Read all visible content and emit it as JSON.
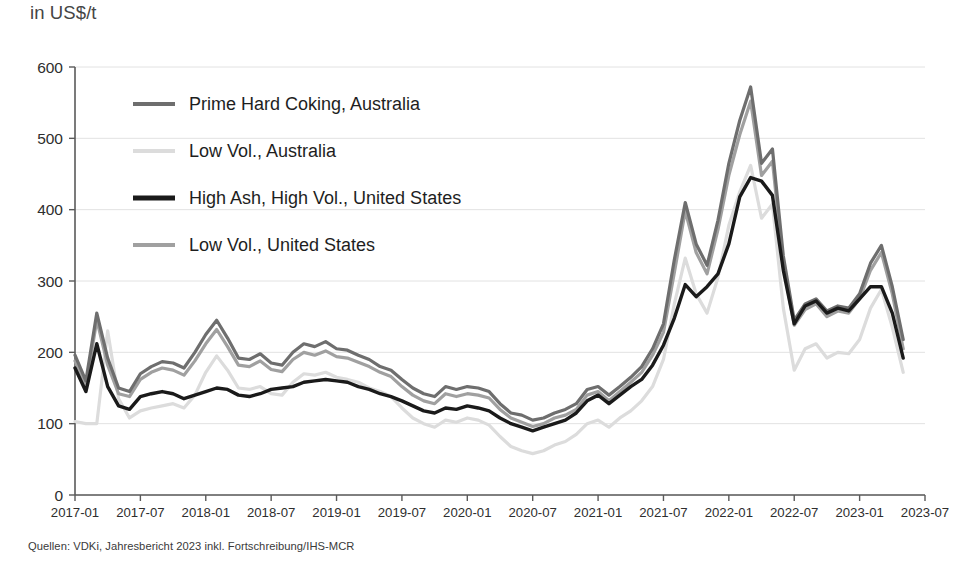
{
  "unit_label": "in US$/t",
  "source_note": "Quellen: VDKi, Jahresbericht 2023 inkl. Fortschreibung/IHS-MCR",
  "chart_data": {
    "type": "line",
    "title": "",
    "subtitle": "",
    "xlabel": "",
    "ylabel": "in US$/t",
    "ylim": [
      0,
      600
    ],
    "yticks": [
      0,
      100,
      200,
      300,
      400,
      500,
      600
    ],
    "xticks": [
      "2017-01",
      "2017-07",
      "2018-01",
      "2018-07",
      "2019-01",
      "2019-07",
      "2020-01",
      "2020-07",
      "2021-01",
      "2021-07",
      "2022-01",
      "2022-07",
      "2023-01",
      "2023-07"
    ],
    "grid": true,
    "legend_position": "upper-left",
    "x_start": "2017-01",
    "x_step_months": 1,
    "x": [
      "2017-01",
      "2017-02",
      "2017-03",
      "2017-04",
      "2017-05",
      "2017-06",
      "2017-07",
      "2017-08",
      "2017-09",
      "2017-10",
      "2017-11",
      "2017-12",
      "2018-01",
      "2018-02",
      "2018-03",
      "2018-04",
      "2018-05",
      "2018-06",
      "2018-07",
      "2018-08",
      "2018-09",
      "2018-10",
      "2018-11",
      "2018-12",
      "2019-01",
      "2019-02",
      "2019-03",
      "2019-04",
      "2019-05",
      "2019-06",
      "2019-07",
      "2019-08",
      "2019-09",
      "2019-10",
      "2019-11",
      "2019-12",
      "2020-01",
      "2020-02",
      "2020-03",
      "2020-04",
      "2020-05",
      "2020-06",
      "2020-07",
      "2020-08",
      "2020-09",
      "2020-10",
      "2020-11",
      "2020-12",
      "2021-01",
      "2021-02",
      "2021-03",
      "2021-04",
      "2021-05",
      "2021-06",
      "2021-07",
      "2021-08",
      "2021-09",
      "2021-10",
      "2021-11",
      "2021-12",
      "2022-01",
      "2022-02",
      "2022-03",
      "2022-04",
      "2022-05",
      "2022-06",
      "2022-07",
      "2022-08",
      "2022-09",
      "2022-10",
      "2022-11",
      "2022-12",
      "2023-01",
      "2023-02",
      "2023-03",
      "2023-04",
      "2023-05"
    ],
    "series": [
      {
        "name": "Prime Hard Coking, Australia",
        "color": "#6e6e6e",
        "stroke_width": 3.2,
        "values": [
          196,
          160,
          255,
          192,
          150,
          145,
          170,
          180,
          187,
          185,
          178,
          200,
          225,
          245,
          220,
          192,
          190,
          198,
          185,
          182,
          200,
          212,
          208,
          215,
          205,
          203,
          196,
          190,
          180,
          175,
          162,
          150,
          142,
          138,
          152,
          148,
          152,
          150,
          145,
          128,
          115,
          112,
          105,
          108,
          115,
          120,
          128,
          148,
          152,
          140,
          152,
          165,
          180,
          205,
          240,
          330,
          410,
          352,
          322,
          385,
          465,
          525,
          572,
          465,
          485,
          335,
          245,
          268,
          275,
          258,
          265,
          262,
          282,
          325,
          350,
          292,
          218
        ]
      },
      {
        "name": "Low Vol., Australia",
        "color": "#dcdcdc",
        "stroke_width": 3.2,
        "values": [
          103,
          100,
          100,
          230,
          135,
          108,
          118,
          122,
          125,
          128,
          122,
          140,
          172,
          195,
          175,
          150,
          148,
          152,
          142,
          140,
          158,
          170,
          168,
          172,
          165,
          162,
          158,
          150,
          145,
          138,
          122,
          108,
          100,
          95,
          105,
          102,
          108,
          105,
          98,
          82,
          68,
          62,
          58,
          62,
          70,
          75,
          85,
          100,
          105,
          95,
          108,
          118,
          132,
          152,
          190,
          268,
          332,
          282,
          255,
          305,
          378,
          425,
          462,
          388,
          408,
          262,
          175,
          205,
          212,
          192,
          200,
          198,
          218,
          262,
          288,
          235,
          172
        ]
      },
      {
        "name": "High Ash, High Vol., United States",
        "color": "#1a1a1a",
        "stroke_width": 3.4,
        "values": [
          178,
          145,
          212,
          152,
          125,
          120,
          138,
          142,
          145,
          142,
          135,
          140,
          145,
          150,
          148,
          140,
          138,
          142,
          148,
          150,
          152,
          158,
          160,
          162,
          160,
          158,
          152,
          148,
          142,
          138,
          132,
          125,
          118,
          115,
          122,
          120,
          125,
          122,
          118,
          108,
          100,
          95,
          90,
          95,
          100,
          105,
          115,
          132,
          140,
          128,
          140,
          152,
          162,
          182,
          210,
          248,
          295,
          278,
          292,
          310,
          352,
          418,
          445,
          440,
          420,
          315,
          240,
          265,
          272,
          255,
          262,
          258,
          275,
          292,
          292,
          255,
          192
        ]
      },
      {
        "name": "Low Vol., United States",
        "color": "#a0a0a0",
        "stroke_width": 3.2,
        "values": [
          188,
          152,
          245,
          182,
          142,
          138,
          162,
          172,
          178,
          175,
          168,
          188,
          212,
          232,
          208,
          182,
          180,
          188,
          176,
          173,
          190,
          200,
          196,
          202,
          194,
          192,
          186,
          180,
          172,
          166,
          152,
          140,
          132,
          128,
          142,
          138,
          142,
          140,
          136,
          120,
          108,
          102,
          96,
          100,
          108,
          112,
          120,
          140,
          145,
          132,
          145,
          158,
          172,
          196,
          228,
          312,
          398,
          340,
          310,
          372,
          448,
          505,
          552,
          448,
          468,
          322,
          238,
          260,
          268,
          250,
          258,
          255,
          275,
          315,
          340,
          282,
          205
        ]
      }
    ]
  },
  "axes": {
    "y_tick_labels": [
      "600",
      "500",
      "400",
      "300",
      "200",
      "100",
      "0"
    ],
    "x_tick_labels": [
      "2017-01",
      "2017-07",
      "2018-01",
      "2018-07",
      "2019-01",
      "2019-07",
      "2020-01",
      "2020-07",
      "2021-01",
      "2021-07",
      "2022-01",
      "2022-07",
      "2023-01",
      "2023-07"
    ]
  },
  "legend": {
    "items": [
      {
        "label": "Prime Hard Coking, Australia",
        "color": "#6e6e6e"
      },
      {
        "label": "Low Vol., Australia",
        "color": "#dcdcdc"
      },
      {
        "label": "High Ash, High Vol., United States",
        "color": "#1a1a1a"
      },
      {
        "label": "Low Vol., United States",
        "color": "#a0a0a0"
      }
    ]
  }
}
